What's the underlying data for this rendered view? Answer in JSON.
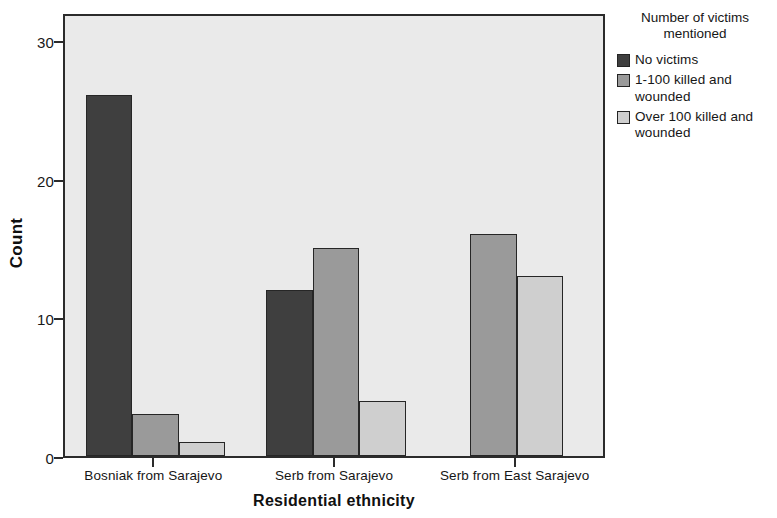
{
  "chart_data": {
    "type": "bar",
    "title": "",
    "xlabel": "Residential ethnicity",
    "ylabel": "Count",
    "categories": [
      "Bosniak from Sarajevo",
      "Serb from Sarajevo",
      "Serb from East Sarajevo"
    ],
    "series": [
      {
        "name": "No victims",
        "color": "#3f3f3f",
        "values": [
          26,
          12,
          null
        ]
      },
      {
        "name": "1-100 killed and wounded",
        "color": "#9a9a9a",
        "values": [
          3,
          15,
          16
        ]
      },
      {
        "name": "Over 100 killed and wounded",
        "color": "#cfcfcf",
        "values": [
          1,
          4,
          13
        ]
      }
    ],
    "ylim": [
      0,
      32
    ],
    "yticks": [
      0,
      10,
      20,
      30
    ],
    "ytick_labels": [
      "0",
      "10",
      "20",
      "30"
    ],
    "grid": false,
    "legend_position": "right",
    "legend_title": "Number of victims mentioned",
    "plot_background": "#eaeaea",
    "axis_color": "#2b2b2b"
  },
  "legend": {
    "title_line1": "Number of victims",
    "title_line2": "mentioned",
    "items": [
      {
        "label": "No victims"
      },
      {
        "label": "1-100 killed and wounded"
      },
      {
        "label": "Over 100 killed and wounded"
      }
    ]
  },
  "axes": {
    "y_title": "Count",
    "x_title": "Residential ethnicity"
  }
}
